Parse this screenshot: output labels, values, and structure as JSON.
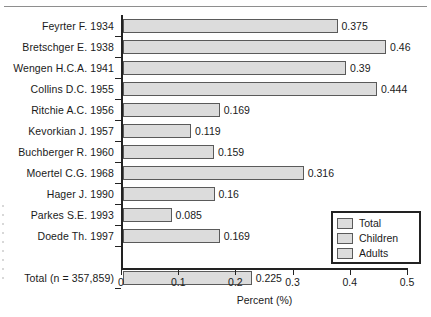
{
  "chart_data": {
    "type": "bar",
    "orientation": "horizontal",
    "title": "",
    "xlabel": "Percent (%)",
    "ylabel": "",
    "xlim": [
      0,
      0.5
    ],
    "xticks": [
      "0",
      "0.1",
      "0.2",
      "0.3",
      "0.4",
      "0.5"
    ],
    "xtick_values": [
      0,
      0.1,
      0.2,
      0.3,
      0.4,
      0.5
    ],
    "grid": false,
    "legend_position": "bottom-right",
    "categories": [
      "Feyrter F. 1934",
      "Bretschger E. 1938",
      "Wengen H.C.A. 1941",
      "Collins D.C. 1955",
      "Ritchie A.C. 1956",
      "Kevorkian J. 1957",
      "Buchberger R. 1960",
      "Moertel C.G. 1968",
      "Hager J. 1990",
      "Parkes S.E. 1993",
      "Doede Th. 1997",
      "Total (n = 357,859)"
    ],
    "values": [
      0.375,
      0.46,
      0.39,
      0.444,
      0.169,
      0.119,
      0.159,
      0.316,
      0.16,
      0.085,
      0.169,
      0.225
    ],
    "value_labels": [
      "0.375",
      "0.46",
      "0.39",
      "0.444",
      "0.169",
      "0.119",
      "0.159",
      "0.316",
      "0.16",
      "0.085",
      "0.169",
      "0.225"
    ],
    "legend": [
      "Total",
      "Children",
      "Adults"
    ],
    "series": [
      {
        "name": "Total",
        "values": [
          0.375,
          0.46,
          0.39,
          0.444,
          0.169,
          0.119,
          0.159,
          0.316,
          0.16,
          0.085,
          0.169,
          0.225
        ]
      }
    ],
    "colors": {
      "bar_fill": "#dcdcdc",
      "bar_stroke": "#5a5a5a",
      "axis": "#222222",
      "text": "#1a1a1a"
    }
  },
  "legend": {
    "items": [
      {
        "label": "Total"
      },
      {
        "label": "Children"
      },
      {
        "label": "Adults"
      }
    ]
  },
  "axis": {
    "x_title": "Percent (%)",
    "ticks": [
      {
        "label": "0"
      },
      {
        "label": "0.1"
      },
      {
        "label": "0.2"
      },
      {
        "label": "0.3"
      },
      {
        "label": "0.4"
      },
      {
        "label": "0.5"
      }
    ]
  },
  "rows": [
    {
      "label": "Feyrter F. 1934",
      "value": "0.375"
    },
    {
      "label": "Bretschger E. 1938",
      "value": "0.46"
    },
    {
      "label": "Wengen H.C.A. 1941",
      "value": "0.39"
    },
    {
      "label": "Collins D.C. 1955",
      "value": "0.444"
    },
    {
      "label": "Ritchie A.C. 1956",
      "value": "0.169"
    },
    {
      "label": "Kevorkian J. 1957",
      "value": "0.119"
    },
    {
      "label": "Buchberger R. 1960",
      "value": "0.159"
    },
    {
      "label": "Moertel C.G. 1968",
      "value": "0.316"
    },
    {
      "label": "Hager J. 1990",
      "value": "0.16"
    },
    {
      "label": "Parkes S.E. 1993",
      "value": "0.085"
    },
    {
      "label": "Doede Th. 1997",
      "value": "0.169"
    },
    {
      "label": "Total (n = 357,859)",
      "value": "0.225"
    }
  ]
}
